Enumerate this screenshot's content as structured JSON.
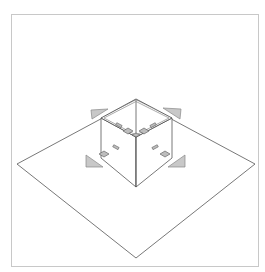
{
  "diagram": {
    "title": "",
    "colors": {
      "frame_border": "#c8c8c8",
      "line": "#555555",
      "triangle_fill": "#c8c8c8",
      "triangle_stroke": "#888888",
      "pad_fill": "#bdbdbd",
      "pad_stroke": "#555555",
      "background": "#ffffff"
    },
    "ground_plane": {
      "points": [
        [
          136,
          100
        ],
        [
          255,
          164
        ],
        [
          136,
          258
        ],
        [
          17,
          164
        ]
      ]
    },
    "cube": {
      "top_back": [
        136,
        100
      ],
      "top_left": [
        101,
        118
      ],
      "top_right": [
        172,
        118
      ],
      "top_front": [
        136,
        137
      ],
      "bottom_left": [
        101,
        158
      ],
      "bottom_right": [
        172,
        158
      ],
      "bottom_front": [
        136,
        187
      ]
    },
    "triangles": [
      {
        "name": "top-left",
        "points": [
          [
            91,
            110
          ],
          [
            108,
            110
          ],
          [
            92,
            118
          ]
        ]
      },
      {
        "name": "top-right",
        "points": [
          [
            163,
            108
          ],
          [
            181,
            108
          ],
          [
            180,
            118
          ]
        ]
      },
      {
        "name": "bottom-left",
        "points": [
          [
            86,
            156
          ],
          [
            86,
            167
          ],
          [
            103,
            167
          ]
        ]
      },
      {
        "name": "bottom-right",
        "points": [
          [
            185,
            156
          ],
          [
            185,
            167
          ],
          [
            168,
            167
          ]
        ]
      }
    ],
    "labels": []
  }
}
